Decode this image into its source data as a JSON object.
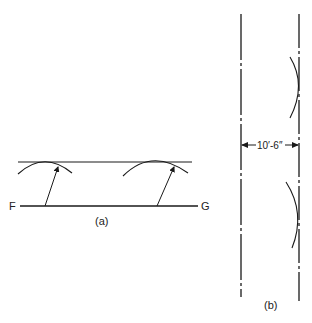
{
  "figure_a": {
    "label": "(a)",
    "line_start_label": "F",
    "line_end_label": "G",
    "description": "Line FG with a parallel line drawn above using two arc swings of equal radius"
  },
  "figure_b": {
    "label": "(b)",
    "dimension": "10′-6″",
    "description": "Two parallel center lines spaced 10′-6″ apart, with arcs touching the right line"
  },
  "colors": {
    "stroke": "#1a1a1a",
    "background": "#ffffff"
  }
}
